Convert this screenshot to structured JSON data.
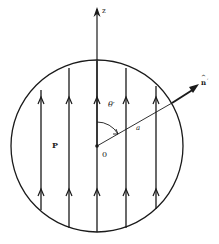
{
  "diagram": {
    "labels": {
      "z_axis": "z",
      "normal": "n",
      "normal_prime": "′",
      "normal_hat": "^",
      "angle": "θ′",
      "radius": "a",
      "point_p": "P",
      "origin": "0"
    },
    "colors": {
      "stroke": "#1a1a1a",
      "background": "#ffffff"
    },
    "geometry": {
      "circle_center": [
        97,
        146
      ],
      "circle_radius": 86,
      "field_line_x": [
        41,
        69,
        97,
        126,
        156
      ],
      "field_direction": "up"
    }
  }
}
